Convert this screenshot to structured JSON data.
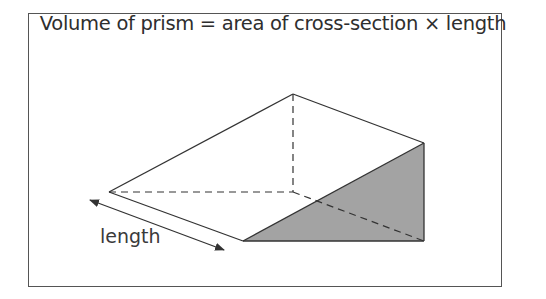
{
  "diagram": {
    "title": "Volume of prism = area of cross-section × length",
    "length_label": "length",
    "colors": {
      "stroke": "#333333",
      "shaded_face": "#a3a3a3",
      "frame": "#555555"
    },
    "vertices": {
      "top_apex": [
        293,
        94
      ],
      "left_vertex": [
        109,
        192
      ],
      "hidden_corner": [
        293,
        192
      ],
      "right_top": [
        424,
        143
      ],
      "front_bottom_left": [
        243,
        241
      ],
      "front_bottom_right": [
        424,
        241
      ]
    }
  }
}
